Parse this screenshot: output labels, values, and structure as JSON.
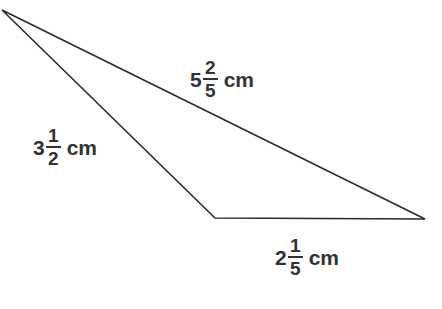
{
  "figure": {
    "name": "triangle-with-fractional-side-lengths",
    "background_color": "#ffffff",
    "stroke_color": "#2b2b2b",
    "text_color": "#333333",
    "stroke_width": 1.6,
    "width": 442,
    "height": 309,
    "vertices": [
      {
        "name": "apex-top-left",
        "x": 2,
        "y": 10
      },
      {
        "name": "vertex-right",
        "x": 425,
        "y": 219
      },
      {
        "name": "vertex-bottom-mid",
        "x": 215,
        "y": 218
      }
    ],
    "outline_path": "M 2 10 L 425 219 L 215 218 Z"
  },
  "labels": {
    "top": {
      "whole": "5",
      "numerator": "2",
      "denominator": "5",
      "unit": "cm",
      "full_text": "5 2/5 cm"
    },
    "left": {
      "whole": "3",
      "numerator": "1",
      "denominator": "2",
      "unit": "cm",
      "full_text": "3 1/2 cm"
    },
    "bottom": {
      "whole": "2",
      "numerator": "1",
      "denominator": "5",
      "unit": "cm",
      "full_text": "2 1/5 cm"
    }
  }
}
